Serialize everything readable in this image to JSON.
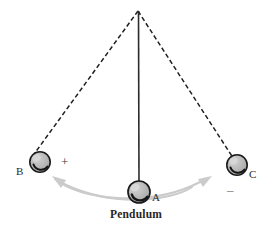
{
  "figure": {
    "title_caption": "Pendulum",
    "background_color": "#ffffff",
    "rod_color": "#2b2b2b",
    "dash_color": "#1f1f1f",
    "bob_fill": "#b3b3b3",
    "bob_stroke": "#1a1a1a",
    "arc_color": "#c9c9c9",
    "pivot": {
      "x": 138,
      "y": 11,
      "label": "pivot"
    },
    "bobs": [
      {
        "id": "A",
        "label": "A",
        "x": 139,
        "y": 192,
        "r": 11,
        "line_style": "solid",
        "position_name": "equilibrium"
      },
      {
        "id": "B",
        "label": "B",
        "x": 40,
        "y": 162,
        "r": 10,
        "line_style": "dashed",
        "position_name": "left-extreme"
      },
      {
        "id": "C",
        "label": "C",
        "x": 237,
        "y": 165,
        "r": 10,
        "line_style": "dashed",
        "position_name": "right-extreme"
      }
    ],
    "signs": [
      {
        "id": "plus",
        "text": "+",
        "x": 61,
        "y": 155
      },
      {
        "id": "minus",
        "text": "–",
        "x": 227,
        "y": 183
      }
    ],
    "labels": [
      {
        "id": "B",
        "text": "B",
        "x": 16,
        "y": 166
      },
      {
        "id": "A",
        "text": "A",
        "x": 152,
        "y": 192
      },
      {
        "id": "C",
        "text": "C",
        "x": 249,
        "y": 169
      },
      {
        "id": "caption",
        "text": "Pendulum",
        "x": 110,
        "y": 209
      }
    ],
    "arcs": [
      {
        "id": "swing-arrow-to-B",
        "direction": "left",
        "arrow_at": "B"
      },
      {
        "id": "swing-arrow-to-C",
        "direction": "right",
        "arrow_at": "C"
      }
    ]
  }
}
